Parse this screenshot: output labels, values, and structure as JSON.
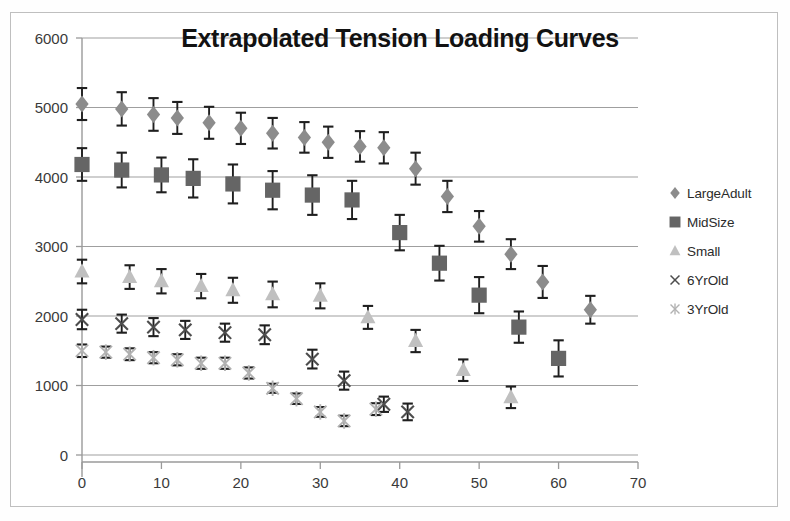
{
  "chart_data": {
    "type": "scatter",
    "title": "Extrapolated Tension Loading Curves",
    "xlabel": "",
    "ylabel": "",
    "xlim": [
      0,
      70
    ],
    "ylim": [
      0,
      6000
    ],
    "xticks": [
      0,
      10,
      20,
      30,
      40,
      50,
      60,
      70
    ],
    "yticks": [
      0,
      1000,
      2000,
      3000,
      4000,
      5000,
      6000
    ],
    "grid": "horizontal",
    "legend_position": "right",
    "error_bars": true,
    "series": [
      {
        "name": "LargeAdult",
        "marker": "diamond",
        "color": "#8c8c8c",
        "points": [
          {
            "x": 0,
            "y": 5050,
            "err": 230
          },
          {
            "x": 5,
            "y": 4980,
            "err": 240
          },
          {
            "x": 9,
            "y": 4900,
            "err": 235
          },
          {
            "x": 12,
            "y": 4850,
            "err": 230
          },
          {
            "x": 16,
            "y": 4780,
            "err": 230
          },
          {
            "x": 20,
            "y": 4700,
            "err": 225
          },
          {
            "x": 24,
            "y": 4630,
            "err": 220
          },
          {
            "x": 28,
            "y": 4570,
            "err": 220
          },
          {
            "x": 31,
            "y": 4500,
            "err": 225
          },
          {
            "x": 35,
            "y": 4440,
            "err": 220
          },
          {
            "x": 38,
            "y": 4420,
            "err": 225
          },
          {
            "x": 42,
            "y": 4120,
            "err": 230
          },
          {
            "x": 46,
            "y": 3720,
            "err": 225
          },
          {
            "x": 50,
            "y": 3290,
            "err": 220
          },
          {
            "x": 54,
            "y": 2890,
            "err": 215
          },
          {
            "x": 58,
            "y": 2490,
            "err": 230
          },
          {
            "x": 64,
            "y": 2090,
            "err": 200
          }
        ]
      },
      {
        "name": "MidSize",
        "marker": "square",
        "color": "#656565",
        "points": [
          {
            "x": 0,
            "y": 4180,
            "err": 235
          },
          {
            "x": 5,
            "y": 4100,
            "err": 250
          },
          {
            "x": 10,
            "y": 4030,
            "err": 250
          },
          {
            "x": 14,
            "y": 3980,
            "err": 275
          },
          {
            "x": 19,
            "y": 3900,
            "err": 280
          },
          {
            "x": 24,
            "y": 3810,
            "err": 275
          },
          {
            "x": 29,
            "y": 3740,
            "err": 285
          },
          {
            "x": 34,
            "y": 3670,
            "err": 275
          },
          {
            "x": 40,
            "y": 3200,
            "err": 255
          },
          {
            "x": 45,
            "y": 2760,
            "err": 250
          },
          {
            "x": 50,
            "y": 2300,
            "err": 260
          },
          {
            "x": 55,
            "y": 1840,
            "err": 225
          },
          {
            "x": 60,
            "y": 1390,
            "err": 260
          }
        ]
      },
      {
        "name": "Small",
        "marker": "triangle",
        "color": "#c0c0c0",
        "points": [
          {
            "x": 0,
            "y": 2640,
            "err": 170
          },
          {
            "x": 6,
            "y": 2560,
            "err": 170
          },
          {
            "x": 10,
            "y": 2500,
            "err": 175
          },
          {
            "x": 15,
            "y": 2430,
            "err": 175
          },
          {
            "x": 19,
            "y": 2370,
            "err": 180
          },
          {
            "x": 24,
            "y": 2310,
            "err": 185
          },
          {
            "x": 30,
            "y": 2290,
            "err": 180
          },
          {
            "x": 36,
            "y": 1980,
            "err": 165
          },
          {
            "x": 42,
            "y": 1640,
            "err": 160
          },
          {
            "x": 48,
            "y": 1220,
            "err": 155
          },
          {
            "x": 54,
            "y": 830,
            "err": 155
          }
        ]
      },
      {
        "name": "6YrOld",
        "marker": "x",
        "color": "#4d4d4d",
        "points": [
          {
            "x": 0,
            "y": 1950,
            "err": 140
          },
          {
            "x": 5,
            "y": 1890,
            "err": 130
          },
          {
            "x": 9,
            "y": 1840,
            "err": 130
          },
          {
            "x": 13,
            "y": 1800,
            "err": 130
          },
          {
            "x": 18,
            "y": 1760,
            "err": 130
          },
          {
            "x": 23,
            "y": 1730,
            "err": 135
          },
          {
            "x": 29,
            "y": 1380,
            "err": 135
          },
          {
            "x": 33,
            "y": 1070,
            "err": 130
          },
          {
            "x": 38,
            "y": 730,
            "err": 110
          },
          {
            "x": 41,
            "y": 620,
            "err": 120
          }
        ]
      },
      {
        "name": "3YrOld",
        "marker": "asterisk",
        "color": "#b2b2b2",
        "points": [
          {
            "x": 0,
            "y": 1500,
            "err": 90
          },
          {
            "x": 3,
            "y": 1480,
            "err": 80
          },
          {
            "x": 6,
            "y": 1450,
            "err": 85
          },
          {
            "x": 9,
            "y": 1400,
            "err": 80
          },
          {
            "x": 12,
            "y": 1370,
            "err": 80
          },
          {
            "x": 15,
            "y": 1320,
            "err": 80
          },
          {
            "x": 18,
            "y": 1320,
            "err": 80
          },
          {
            "x": 21,
            "y": 1180,
            "err": 80
          },
          {
            "x": 24,
            "y": 960,
            "err": 65
          },
          {
            "x": 27,
            "y": 810,
            "err": 75
          },
          {
            "x": 30,
            "y": 620,
            "err": 70
          },
          {
            "x": 33,
            "y": 490,
            "err": 75
          },
          {
            "x": 37,
            "y": 660,
            "err": 85
          }
        ]
      }
    ]
  },
  "legend": {
    "items": [
      {
        "label": "LargeAdult",
        "marker": "diamond",
        "color": "#8c8c8c"
      },
      {
        "label": "MidSize",
        "marker": "square",
        "color": "#656565"
      },
      {
        "label": "Small",
        "marker": "triangle",
        "color": "#c0c0c0"
      },
      {
        "label": "6YrOld",
        "marker": "x",
        "color": "#4d4d4d"
      },
      {
        "label": "3YrOld",
        "marker": "asterisk",
        "color": "#b2b2b2"
      }
    ]
  },
  "colors": {
    "background": "#ffffff",
    "frame": "#bfbfbf",
    "gridline": "#8f8f8f",
    "axis": "#9a9a9a",
    "title_text": "#121212",
    "tick_text": "#3a3a3a",
    "errorbar": "#1f1f1f"
  }
}
